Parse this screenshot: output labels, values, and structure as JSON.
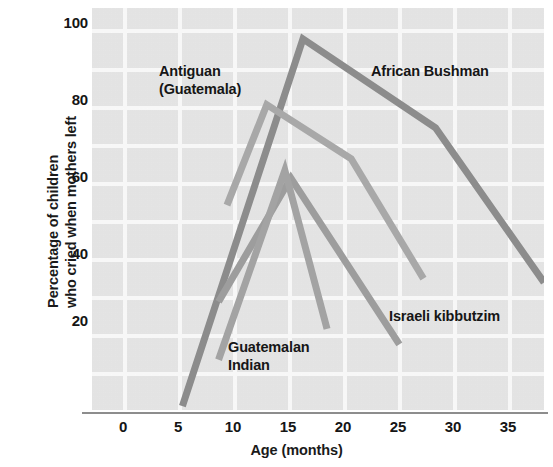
{
  "chart_data": {
    "type": "line",
    "title": "",
    "xlabel": "Age (months)",
    "ylabel": "Percentage of children who cried when mothers left",
    "ylabel_line1": "Percentage of children",
    "ylabel_line2": "who cried when mothers left",
    "xlim": [
      -2.5,
      35
    ],
    "ylim": [
      0,
      104
    ],
    "xticks": [
      0,
      5,
      10,
      15,
      20,
      25,
      30,
      35
    ],
    "xtick_labels": [
      "0",
      "5",
      "10",
      "15",
      "20",
      "25",
      "30",
      "35"
    ],
    "yticks": [
      20,
      40,
      60,
      80,
      100
    ],
    "ytick_labels": [
      "20",
      "40",
      "60",
      "80",
      "100"
    ],
    "grid": true,
    "grid_color": "#fbfbfb",
    "plot_background": "#e7e7e7",
    "legend": "inline-annotations",
    "series": [
      {
        "name": "African Bushman",
        "color": "#8c8c8c",
        "width": 7,
        "label_position": "upper-right",
        "x": [
          5,
          15,
          26,
          35
        ],
        "y": [
          1,
          96,
          73,
          33
        ]
      },
      {
        "name": "Antiguan (Guatemala)",
        "color": "#a8a8a8",
        "width": 7,
        "label_position": "upper-left",
        "x": [
          8.7,
          12,
          19,
          25
        ],
        "y": [
          53,
          79,
          65,
          34
        ]
      },
      {
        "name": "Israeli kibbutzim",
        "color": "#9d9d9d",
        "width": 7,
        "label_position": "lower-right",
        "x": [
          8,
          14,
          23
        ],
        "y": [
          28,
          60,
          17
        ]
      },
      {
        "name": "Guatemalan Indian",
        "color": "#a3a3a3",
        "width": 7,
        "label_position": "lower-left",
        "x": [
          8,
          13.5,
          17
        ],
        "y": [
          13,
          62,
          21
        ]
      }
    ],
    "annotations": [
      {
        "id": "antiguan",
        "text_line1": "Antiguan",
        "text_line2": "(Guatemala)"
      },
      {
        "id": "bushman",
        "text_line1": "African Bushman",
        "text_line2": ""
      },
      {
        "id": "kibbutzim",
        "text_line1": "Israeli kibbutzim",
        "text_line2": ""
      },
      {
        "id": "guatemalan",
        "text_line1": "Guatemalan",
        "text_line2": "Indian"
      }
    ]
  }
}
